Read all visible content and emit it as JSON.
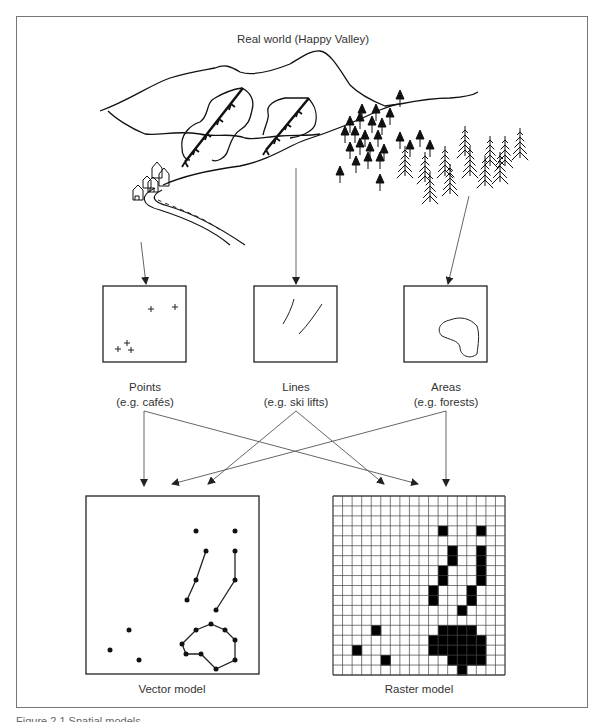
{
  "title": "Real world (Happy Valley)",
  "feature_boxes": [
    {
      "id": "points",
      "label": "Points",
      "example": "(e.g. cafés)"
    },
    {
      "id": "lines",
      "label": "Lines",
      "example": "(e.g. ski lifts)"
    },
    {
      "id": "areas",
      "label": "Areas",
      "example": "(e.g. forests)"
    }
  ],
  "models": {
    "vector": {
      "label": "Vector model"
    },
    "raster": {
      "label": "Raster model",
      "grid_size": 18
    }
  },
  "caption": "Figure 2.1 Spatial models",
  "raster_filled_cells": [
    [
      3,
      11
    ],
    [
      3,
      15
    ],
    [
      5,
      12
    ],
    [
      5,
      15
    ],
    [
      6,
      12
    ],
    [
      6,
      15
    ],
    [
      7,
      11
    ],
    [
      7,
      15
    ],
    [
      8,
      11
    ],
    [
      8,
      15
    ],
    [
      9,
      10
    ],
    [
      9,
      14
    ],
    [
      10,
      10
    ],
    [
      10,
      14
    ],
    [
      11,
      13
    ],
    [
      13,
      4
    ],
    [
      13,
      11
    ],
    [
      13,
      12
    ],
    [
      13,
      13
    ],
    [
      13,
      14
    ],
    [
      14,
      10
    ],
    [
      14,
      11
    ],
    [
      14,
      12
    ],
    [
      14,
      13
    ],
    [
      14,
      14
    ],
    [
      14,
      15
    ],
    [
      15,
      2
    ],
    [
      15,
      10
    ],
    [
      15,
      11
    ],
    [
      15,
      12
    ],
    [
      15,
      13
    ],
    [
      15,
      14
    ],
    [
      15,
      15
    ],
    [
      16,
      5
    ],
    [
      16,
      12
    ],
    [
      16,
      13
    ],
    [
      16,
      14
    ],
    [
      16,
      15
    ],
    [
      17,
      13
    ]
  ],
  "colors": {
    "line": "#111111",
    "frame": "#777777",
    "arrow": "#555555"
  }
}
